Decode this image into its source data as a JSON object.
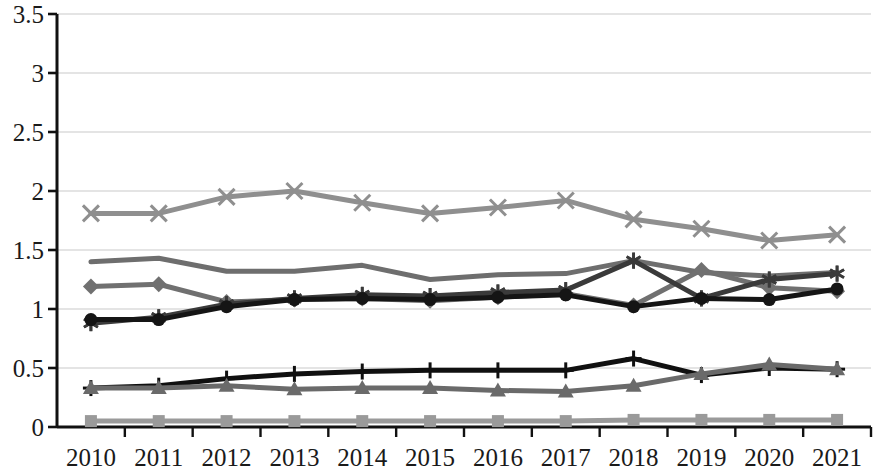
{
  "chart_data": {
    "type": "line",
    "title": "",
    "subtitle": "",
    "xlabel": "",
    "ylabel": "",
    "grid": true,
    "legend_position": "none",
    "xlim": [
      "2010",
      "2021"
    ],
    "ylim": [
      0,
      3.5
    ],
    "ytick_values": [
      0,
      0.5,
      1,
      1.5,
      2,
      2.5,
      3,
      3.5
    ],
    "ytick_labels": [
      "0",
      "0.5",
      "1",
      "1.5",
      "2",
      "2.5",
      "3",
      "3.5"
    ],
    "categories": [
      "2010",
      "2011",
      "2012",
      "2013",
      "2014",
      "2015",
      "2016",
      "2017",
      "2018",
      "2019",
      "2020",
      "2021"
    ],
    "series": [
      {
        "name": "Series 1",
        "marker": "cross-x",
        "color": "#8f8f8f",
        "values": [
          1.81,
          1.81,
          1.95,
          2.0,
          1.9,
          1.81,
          1.86,
          1.92,
          1.76,
          1.68,
          1.58,
          1.63
        ]
      },
      {
        "name": "Series 2",
        "marker": "none",
        "color": "#6e6e6e",
        "values": [
          1.4,
          1.43,
          1.32,
          1.32,
          1.37,
          1.25,
          1.29,
          1.3,
          1.41,
          1.31,
          1.28,
          1.31
        ]
      },
      {
        "name": "Series 3",
        "marker": "diamond",
        "color": "#707070",
        "values": [
          1.19,
          1.21,
          1.06,
          1.08,
          1.09,
          1.07,
          1.1,
          1.13,
          1.03,
          1.33,
          1.18,
          1.15
        ]
      },
      {
        "name": "Series 4",
        "marker": "asterisk",
        "color": "#3a3a3a",
        "values": [
          0.88,
          0.93,
          1.04,
          1.09,
          1.12,
          1.11,
          1.14,
          1.16,
          1.41,
          1.09,
          1.25,
          1.3
        ]
      },
      {
        "name": "Series 5",
        "marker": "circle",
        "color": "#151515",
        "values": [
          0.91,
          0.91,
          1.02,
          1.08,
          1.09,
          1.08,
          1.1,
          1.12,
          1.02,
          1.09,
          1.08,
          1.17
        ]
      },
      {
        "name": "Series 6",
        "marker": "plus",
        "color": "#101010",
        "values": [
          0.33,
          0.35,
          0.41,
          0.45,
          0.47,
          0.48,
          0.48,
          0.48,
          0.58,
          0.44,
          0.5,
          0.49
        ]
      },
      {
        "name": "Series 7",
        "marker": "triangle",
        "color": "#6a6a6a",
        "values": [
          0.33,
          0.33,
          0.35,
          0.32,
          0.33,
          0.33,
          0.31,
          0.3,
          0.35,
          0.45,
          0.53,
          0.49
        ]
      },
      {
        "name": "Series 8",
        "marker": "square",
        "color": "#9a9a9a",
        "values": [
          0.05,
          0.05,
          0.05,
          0.05,
          0.05,
          0.05,
          0.05,
          0.05,
          0.06,
          0.06,
          0.06,
          0.06
        ]
      }
    ]
  },
  "axis": {
    "axis_color": "#111111",
    "grid_color": "#c9c9c9"
  }
}
